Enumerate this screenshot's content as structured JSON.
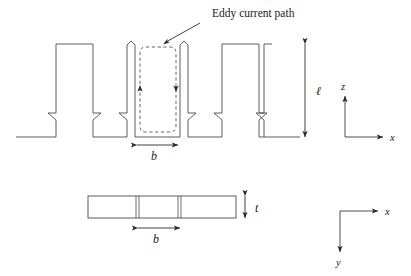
{
  "figure": {
    "type": "technical-diagram",
    "labels": {
      "callout": "Eddy current path",
      "slot_width": "b",
      "tooth_length": "ℓ",
      "plate_thickness": "t",
      "slot_width_plan": "b"
    },
    "axes": {
      "elevation": {
        "vertical_label": "z",
        "horizontal_label": "x"
      },
      "plan": {
        "vertical_label": "y",
        "horizontal_label": "x"
      }
    },
    "eddy_loop": {
      "left_arrow_direction": "up",
      "right_arrow_direction": "down",
      "style": "dashed-rounded-rectangle"
    },
    "views": [
      {
        "name": "elevation-view",
        "description": "Front view showing comb teeth and slots"
      },
      {
        "name": "plan-view",
        "description": "Top view showing plate thickness t and slot spacing b"
      }
    ],
    "colors": {
      "outline": "#4a4a4a",
      "dashed": "#555555",
      "text": "#1a1a1a",
      "background": "#ffffff"
    }
  }
}
